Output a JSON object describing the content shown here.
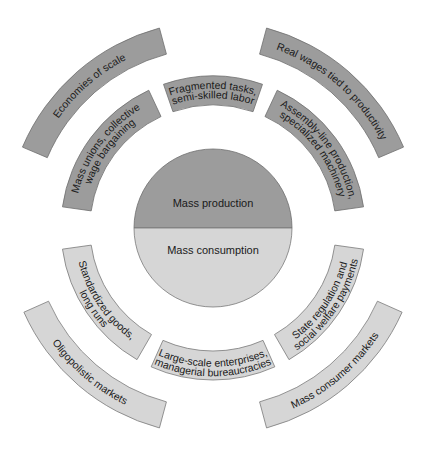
{
  "diagram": {
    "center": {
      "top_label": "Mass production",
      "bottom_label": "Mass consumption",
      "top_color": "#9c9c9c",
      "bottom_color": "#d6d6d6"
    },
    "inner_ring": [
      {
        "id": "mass-unions",
        "lines": [
          "Mass unions, collective",
          "wage bargaining"
        ],
        "tone": "dark",
        "start": 188,
        "end": 245
      },
      {
        "id": "fragmented-tasks",
        "lines": [
          "Fragmented tasks,",
          "semi-skilled labor"
        ],
        "tone": "dark",
        "start": 251,
        "end": 289
      },
      {
        "id": "assembly-line",
        "lines": [
          "Assembly-line production,",
          "specialized machinery"
        ],
        "tone": "dark",
        "start": 295,
        "end": 352
      },
      {
        "id": "state-regulation",
        "lines": [
          "State regulation and",
          "social welfare payments"
        ],
        "tone": "light",
        "start": 8,
        "end": 60
      },
      {
        "id": "large-scale-enterprises",
        "lines": [
          "Large-scale enterprises,",
          "managerial bureaucracies"
        ],
        "tone": "light",
        "start": 66,
        "end": 114
      },
      {
        "id": "standardized-goods",
        "lines": [
          "Standardized goods,",
          "long runs"
        ],
        "tone": "light",
        "start": 120,
        "end": 172
      }
    ],
    "outer_ring": [
      {
        "id": "economies-of-scale",
        "lines": [
          "Economies of scale"
        ],
        "tone": "dark",
        "start": 203,
        "end": 255
      },
      {
        "id": "real-wages",
        "lines": [
          "Real wages tied to productivity"
        ],
        "tone": "dark",
        "start": 285,
        "end": 337
      },
      {
        "id": "mass-consumer-markets",
        "lines": [
          "Mass consumer markets"
        ],
        "tone": "light",
        "start": 24,
        "end": 75
      },
      {
        "id": "oligopolistic-markets",
        "lines": [
          "Oligopolistic markets"
        ],
        "tone": "light",
        "start": 105,
        "end": 156
      }
    ]
  }
}
